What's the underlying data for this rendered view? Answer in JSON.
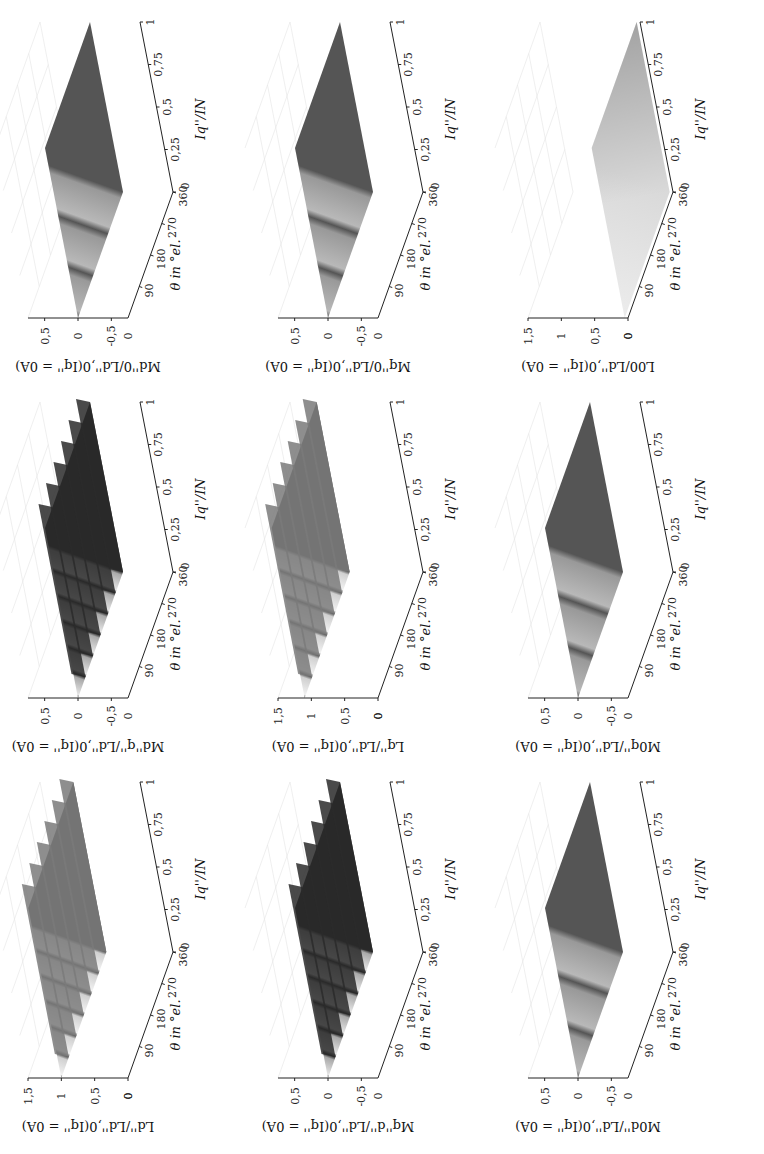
{
  "figure": {
    "orientation": "rotated 90° clockwise (page rotated, text upright when image turned left)",
    "grid": {
      "rows": 3,
      "cols": 3
    }
  },
  "chart_data": [
    {
      "id": "p11",
      "type": "surface3d",
      "row": 0,
      "col": 0,
      "zlabel": "M_{d''0}/L_{d'',0}(I_{q''} = 0A)",
      "zlabel_text": "Md''0/Ld'',0(Iq'' = 0A)",
      "xlabel": "θ in °el.",
      "ylabel": "Iq''/IN",
      "xticks": [
        "90",
        "180",
        "270",
        "360"
      ],
      "yticks": [
        "0",
        "0,25",
        "0,5",
        "0,75",
        "1"
      ],
      "zticks": [
        "0,5",
        "0",
        "-0,5"
      ],
      "zlim": [
        -0.75,
        0.75
      ],
      "surface": {
        "mean": 0.0,
        "ripple_amplitude": 0.05,
        "ripples": 3,
        "shade": "mid-gray",
        "style": "flat"
      }
    },
    {
      "id": "p12",
      "type": "surface3d",
      "row": 0,
      "col": 1,
      "zlabel": "M_{q''0}/L_{d'',0}(I_{q''} = 0A)",
      "zlabel_text": "Mq''0/Ld'',0(Iq'' = 0A)",
      "xlabel": "θ in °el.",
      "ylabel": "Iq''/IN",
      "xticks": [
        "90",
        "180",
        "270",
        "360"
      ],
      "yticks": [
        "0",
        "0,25",
        "0,5",
        "0,75",
        "1"
      ],
      "zticks": [
        "0,5",
        "0",
        "-0,5"
      ],
      "zlim": [
        -0.75,
        0.75
      ],
      "surface": {
        "mean": 0.0,
        "ripple_amplitude": 0.05,
        "ripples": 3,
        "shade": "mid-gray",
        "style": "flat"
      }
    },
    {
      "id": "p13",
      "type": "surface3d",
      "row": 0,
      "col": 2,
      "zlabel": "L_{00}/L_{d'',0}(I_{q''} = 0A)",
      "zlabel_text": "L00/Ld'',0(Iq'' = 0A)",
      "xlabel": "θ in °el.",
      "ylabel": "Iq''/IN",
      "xticks": [
        "90",
        "180",
        "270",
        "360"
      ],
      "yticks": [
        "0",
        "0,25",
        "0,5",
        "0,75",
        "1"
      ],
      "zticks": [
        "1,5",
        "1",
        "0,5",
        "0"
      ],
      "zlim": [
        0,
        1.5
      ],
      "surface": {
        "mean": 0.05,
        "ripple_amplitude": 0.02,
        "ripples": 0,
        "shade": "light-gray",
        "style": "flat-light"
      }
    },
    {
      "id": "p21",
      "type": "surface3d",
      "row": 1,
      "col": 0,
      "zlabel": "M_{d''q''}/L_{d'',0}(I_{q''} = 0A)",
      "zlabel_text": "Md''q''/Ld'',0(Iq'' = 0A)",
      "xlabel": "θ in °el.",
      "ylabel": "Iq''/IN",
      "xticks": [
        "90",
        "180",
        "270",
        "360"
      ],
      "yticks": [
        "0",
        "0,25",
        "0,5",
        "0,75",
        "1"
      ],
      "zticks": [
        "0,5",
        "0",
        "-0,5"
      ],
      "zlim": [
        -0.75,
        0.75
      ],
      "surface": {
        "mean": 0.0,
        "ripple_amplitude": 0.1,
        "ripples": 6,
        "shade": "dark-stripes",
        "style": "ridged"
      }
    },
    {
      "id": "p22",
      "type": "surface3d",
      "row": 1,
      "col": 1,
      "zlabel": "L_{q''}/L_{d'',0}(I_{q''} = 0A)",
      "zlabel_text": "Lq''/Ld'',0(Iq'' = 0A)",
      "xlabel": "θ in °el.",
      "ylabel": "Iq''/IN",
      "xticks": [
        "90",
        "180",
        "270",
        "360"
      ],
      "yticks": [
        "0",
        "0,25",
        "0,5",
        "0,75",
        "1"
      ],
      "zticks": [
        "1,5",
        "1",
        "0,5",
        "0"
      ],
      "zlim": [
        0,
        1.5
      ],
      "surface": {
        "mean": 1.1,
        "ripple_amplitude": 0.15,
        "ripples": 6,
        "shade": "light-stripes",
        "style": "ridged-decreasing"
      }
    },
    {
      "id": "p23",
      "type": "surface3d",
      "row": 1,
      "col": 2,
      "zlabel": "M_{0q''}/L_{d'',0}(I_{q''} = 0A)",
      "zlabel_text": "M0q''/Ld'',0(Iq'' = 0A)",
      "xlabel": "θ in °el.",
      "ylabel": "Iq''/IN",
      "xticks": [
        "90",
        "180",
        "270",
        "360"
      ],
      "yticks": [
        "0",
        "0,25",
        "0,5",
        "0,75",
        "1"
      ],
      "zticks": [
        "0,5",
        "0",
        "-0,5"
      ],
      "zlim": [
        -0.75,
        0.75
      ],
      "surface": {
        "mean": 0.0,
        "ripple_amplitude": 0.05,
        "ripples": 3,
        "shade": "mid-gray",
        "style": "flat"
      }
    },
    {
      "id": "p31",
      "type": "surface3d",
      "row": 2,
      "col": 0,
      "zlabel": "L_{d''}/L_{d'',0}(I_{q''} = 0A)",
      "zlabel_text": "Ld''/Ld'',0(Iq'' = 0A)",
      "xlabel": "θ in °el.",
      "ylabel": "Iq''/IN",
      "xticks": [
        "90",
        "180",
        "270",
        "360"
      ],
      "yticks": [
        "0",
        "0,25",
        "0,5",
        "0,75",
        "1"
      ],
      "zticks": [
        "1,5",
        "1",
        "0,5",
        "0"
      ],
      "zlim": [
        0,
        1.5
      ],
      "surface": {
        "mean": 1.0,
        "ripple_amplitude": 0.08,
        "ripples": 6,
        "shade": "light-stripes",
        "style": "ridged"
      }
    },
    {
      "id": "p32",
      "type": "surface3d",
      "row": 2,
      "col": 1,
      "zlabel": "M_{q''d''}/L_{d'',0}(I_{q''} = 0A)",
      "zlabel_text": "Mq''d''/Ld'',0(Iq'' = 0A)",
      "xlabel": "θ in °el.",
      "ylabel": "Iq''/IN",
      "xticks": [
        "90",
        "180",
        "270",
        "360"
      ],
      "yticks": [
        "0",
        "0,25",
        "0,5",
        "0,75",
        "1"
      ],
      "zticks": [
        "0,5",
        "0",
        "-0,5"
      ],
      "zlim": [
        -0.75,
        0.75
      ],
      "surface": {
        "mean": 0.0,
        "ripple_amplitude": 0.1,
        "ripples": 6,
        "shade": "dark-stripes",
        "style": "ridged"
      }
    },
    {
      "id": "p33",
      "type": "surface3d",
      "row": 2,
      "col": 2,
      "zlabel": "M_{0d''}/L_{d'',0}(I_{q''} = 0A)",
      "zlabel_text": "M0d''/Ld'',0(Iq'' = 0A)",
      "xlabel": "θ in °el.",
      "ylabel": "Iq''/IN",
      "xticks": [
        "90",
        "180",
        "270",
        "360"
      ],
      "yticks": [
        "0",
        "0,25",
        "0,5",
        "0,75",
        "1"
      ],
      "zticks": [
        "0,5",
        "0",
        "-0,5"
      ],
      "zlim": [
        -0.75,
        0.75
      ],
      "surface": {
        "mean": 0.0,
        "ripple_amplitude": 0.05,
        "ripples": 3,
        "shade": "mid-gray",
        "style": "flat"
      }
    }
  ]
}
